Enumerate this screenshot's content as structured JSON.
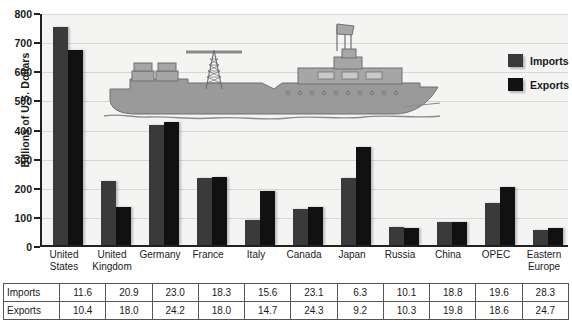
{
  "chart_data": {
    "type": "bar",
    "title": "",
    "xlabel": "",
    "ylabel": "Billions of U.S. Dollars",
    "ylim": [
      0,
      800
    ],
    "ytick_step": 100,
    "yticks": [
      0,
      100,
      200,
      300,
      400,
      500,
      600,
      700,
      800
    ],
    "grid": true,
    "legend_position": "top-right",
    "categories": [
      "United States",
      "United Kingdom",
      "Germany",
      "France",
      "Italy",
      "Canada",
      "Japan",
      "Russia",
      "China",
      "OPEC",
      "Eastern Europe"
    ],
    "categories_wrapped": [
      [
        "United",
        "States"
      ],
      [
        "United",
        "Kingdom"
      ],
      [
        "Germany",
        ""
      ],
      [
        "France",
        ""
      ],
      [
        "Italy",
        ""
      ],
      [
        "Canada",
        ""
      ],
      [
        "Japan",
        ""
      ],
      [
        "Russia",
        ""
      ],
      [
        "China",
        ""
      ],
      [
        "OPEC",
        ""
      ],
      [
        "Eastern",
        "Europe"
      ]
    ],
    "series": [
      {
        "name": "Imports",
        "color": "#3a3a3a",
        "values": [
          750,
          220,
          412,
          230,
          85,
          125,
          230,
          62,
          80,
          145,
          50
        ]
      },
      {
        "name": "Exports",
        "color": "#111111",
        "values": [
          670,
          132,
          424,
          232,
          185,
          132,
          335,
          60,
          80,
          200,
          60
        ]
      }
    ]
  },
  "legend": {
    "items": [
      {
        "label": "Imports",
        "swatch": "imports"
      },
      {
        "label": "Exports",
        "swatch": "exports"
      }
    ]
  },
  "table": {
    "rows": [
      {
        "header": "Imports",
        "values": [
          "11.6",
          "20.9",
          "23.0",
          "18.3",
          "15.6",
          "23.1",
          "6.3",
          "10.1",
          "18.8",
          "19.6",
          "28.3"
        ]
      },
      {
        "header": "Exports",
        "values": [
          "10.4",
          "18.0",
          "24.2",
          "18.0",
          "14.7",
          "24.3",
          "9.2",
          "10.3",
          "19.8",
          "18.6",
          "24.7"
        ]
      }
    ]
  },
  "artwork": {
    "ship_alt": "cargo-ship-illustration"
  },
  "footnote": {
    "text": ""
  }
}
